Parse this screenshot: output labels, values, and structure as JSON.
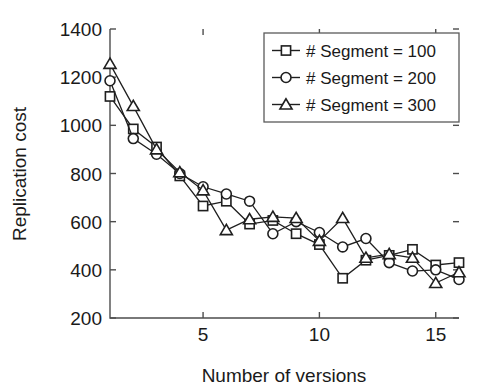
{
  "chart_data": {
    "type": "line",
    "title": "",
    "xlabel": "Number of versions",
    "ylabel": "Replication cost",
    "xlim": [
      1,
      16
    ],
    "ylim": [
      200,
      1400
    ],
    "xticks": [
      5,
      10,
      15
    ],
    "xtick_labels": [
      "5",
      "10",
      "15"
    ],
    "yticks": [
      200,
      400,
      600,
      800,
      1000,
      1200,
      1400
    ],
    "ytick_labels": [
      "200",
      "400",
      "600",
      "800",
      "1000",
      "1200",
      "1400"
    ],
    "grid": false,
    "legend_position": "upper right",
    "x": [
      1,
      2,
      3,
      4,
      5,
      6,
      7,
      8,
      9,
      10,
      11,
      12,
      13,
      14,
      15,
      16
    ],
    "series": [
      {
        "name": "# Segment = 100",
        "marker": "square",
        "values": [
          1120,
          985,
          910,
          790,
          665,
          685,
          590,
          605,
          550,
          505,
          365,
          440,
          460,
          485,
          420,
          430
        ]
      },
      {
        "name": "# Segment = 200",
        "marker": "circle",
        "values": [
          1185,
          945,
          880,
          800,
          745,
          715,
          685,
          550,
          600,
          555,
          495,
          530,
          430,
          395,
          400,
          360
        ]
      },
      {
        "name": "# Segment = 300",
        "marker": "triangle",
        "values": [
          1255,
          1080,
          900,
          805,
          730,
          565,
          610,
          620,
          615,
          520,
          615,
          450,
          465,
          450,
          345,
          390
        ]
      }
    ]
  },
  "legend": {
    "items": [
      {
        "label": "# Segment = 100",
        "marker": "square"
      },
      {
        "label": "# Segment = 200",
        "marker": "circle"
      },
      {
        "label": "# Segment = 300",
        "marker": "triangle"
      }
    ]
  },
  "colors": {
    "line": "#1f1f1f",
    "axis": "#4d4d4d",
    "text": "#1a1a1a",
    "background": "#ffffff"
  }
}
